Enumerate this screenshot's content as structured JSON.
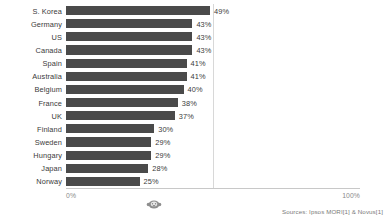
{
  "chart_data": {
    "type": "bar",
    "orientation": "horizontal",
    "title": "",
    "subtitle": "",
    "xlabel": "",
    "ylabel": "",
    "xlim": [
      0,
      100
    ],
    "grid": true,
    "gridlines_at": [
      50
    ],
    "legend": "none",
    "axis_ticks": [
      "0%",
      "100%"
    ],
    "categories": [
      "S. Korea",
      "Germany",
      "US",
      "Canada",
      "Spain",
      "Australia",
      "Belgium",
      "France",
      "UK",
      "Finland",
      "Sweden",
      "Hungary",
      "Japan",
      "Norway"
    ],
    "values": [
      49,
      43,
      43,
      43,
      41,
      41,
      40,
      38,
      37,
      30,
      29,
      29,
      28,
      25
    ],
    "value_labels": [
      "49%",
      "43%",
      "43%",
      "43%",
      "41%",
      "41%",
      "40%",
      "38%",
      "37%",
      "30%",
      "29%",
      "29%",
      "28%",
      "25%"
    ],
    "bar_color": "#4a4a4a",
    "annotations": []
  },
  "axis": {
    "tick_zero": "0%",
    "tick_hundred": "100%"
  },
  "footer": {
    "source": "Sources: Ipsos MORI[1] & Novus[1]"
  },
  "watermark": {
    "name": "circular-logo-watermark"
  }
}
